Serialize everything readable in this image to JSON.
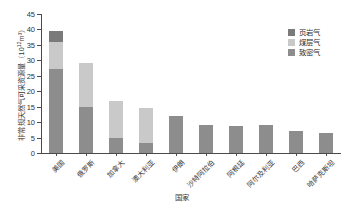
{
  "chart_data": {
    "type": "bar",
    "stacked": true,
    "title": "",
    "subtitle": "",
    "xlabel": "国家",
    "ylabel": "非常规天然气可采资源量（10¹²m³）",
    "ylabel_main": "非常规天然气可采资源量（10",
    "ylabel_sup": "12",
    "ylabel_tail": "m³）",
    "ylim": [
      0,
      45
    ],
    "ytick_values": [
      0,
      5,
      10,
      15,
      20,
      25,
      30,
      35,
      40,
      45
    ],
    "ytick_labels": [
      "0",
      "5",
      "10",
      "15",
      "20",
      "25",
      "30",
      "35",
      "40",
      "45"
    ],
    "grid": false,
    "legend_position": "upper-right",
    "categories": [
      "美国",
      "俄罗斯",
      "加拿大",
      "澳大利亚",
      "伊朗",
      "沙特阿拉伯",
      "阿根廷",
      "阿尔及利亚",
      "巴西",
      "哈萨克斯坦"
    ],
    "series": [
      {
        "name": "致密气",
        "color": "#8d8d8d",
        "values": [
          27.3,
          15.0,
          5.0,
          3.2,
          12.0,
          9.0,
          8.6,
          9.0,
          7.0,
          6.5
        ]
      },
      {
        "name": "煤层气",
        "color": "#c9c9c9",
        "values": [
          8.5,
          14.0,
          12.0,
          11.3,
          0.0,
          0.0,
          0.0,
          0.0,
          0.0,
          0.0
        ]
      },
      {
        "name": "页岩气",
        "color": "#7a7a7a",
        "values": [
          3.7,
          0.0,
          0.0,
          0.0,
          0.0,
          0.0,
          0.0,
          0.0,
          0.0,
          0.0
        ]
      }
    ],
    "totals": [
      39.5,
      29.0,
      17.0,
      14.5,
      12.0,
      9.0,
      8.6,
      9.0,
      7.0,
      6.5
    ]
  },
  "legend": {
    "entries": [
      {
        "label": "页岩气",
        "color": "#7a7a7a"
      },
      {
        "label": "煤层气",
        "color": "#c9c9c9"
      },
      {
        "label": "致密气",
        "color": "#8d8d8d"
      }
    ]
  },
  "axis": {
    "y_title_text": "非常规天然气可采资源量（10",
    "y_title_sup": "12",
    "y_title_unit": "m³）",
    "x_title": "国家"
  }
}
